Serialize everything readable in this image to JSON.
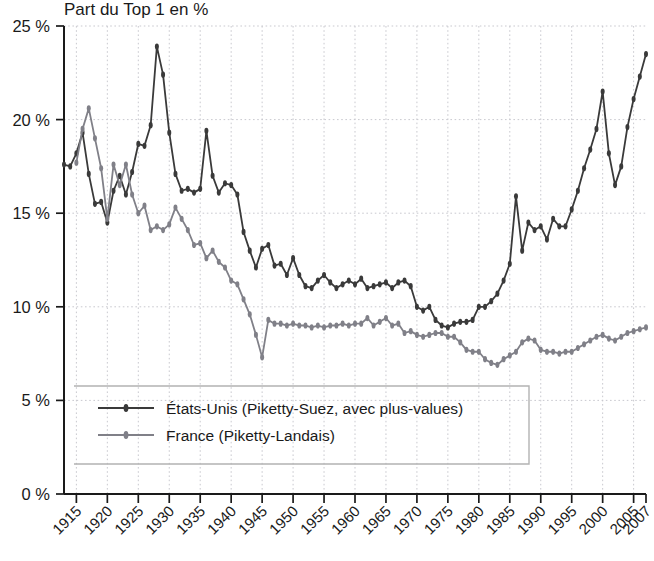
{
  "chart_data": {
    "type": "line",
    "title": "Part du Top 1 en %",
    "xlabel": "",
    "ylabel": "",
    "ylim": [
      0,
      25
    ],
    "xlim": [
      1913,
      2007
    ],
    "grid": true,
    "legend_position": "bottom-left",
    "y_ticks": [
      0,
      5,
      10,
      15,
      20,
      25
    ],
    "y_tick_labels": [
      "0 %",
      "5 %",
      "10 %",
      "15 %",
      "20 %",
      "25 %"
    ],
    "x_ticks": [
      1915,
      1920,
      1925,
      1930,
      1935,
      1940,
      1945,
      1950,
      1955,
      1960,
      1965,
      1970,
      1975,
      1980,
      1985,
      1990,
      1995,
      2000,
      2005,
      2007
    ],
    "x_tick_labels": [
      "1915",
      "1920",
      "1925",
      "1930",
      "1935",
      "1940",
      "1945",
      "1950",
      "1955",
      "1960",
      "1965",
      "1970",
      "1975",
      "1980",
      "1985",
      "1990",
      "1995",
      "2000",
      "2005",
      "2007"
    ],
    "colors": {
      "etats_unis": "#3a3a3a",
      "france": "#808088",
      "grid": "#c9c9cf",
      "axis": "#1a1a1a",
      "background": "#ffffff"
    },
    "series": [
      {
        "name": "États-Unis (Piketty-Suez, avec plus-values)",
        "color": "#3a3a3a",
        "x": [
          1913,
          1914,
          1915,
          1916,
          1917,
          1918,
          1919,
          1920,
          1921,
          1922,
          1923,
          1924,
          1925,
          1926,
          1927,
          1928,
          1929,
          1930,
          1931,
          1932,
          1933,
          1934,
          1935,
          1936,
          1937,
          1938,
          1939,
          1940,
          1941,
          1942,
          1943,
          1944,
          1945,
          1946,
          1947,
          1948,
          1949,
          1950,
          1951,
          1952,
          1953,
          1954,
          1955,
          1956,
          1957,
          1958,
          1959,
          1960,
          1961,
          1962,
          1963,
          1964,
          1965,
          1966,
          1967,
          1968,
          1969,
          1970,
          1971,
          1972,
          1973,
          1974,
          1975,
          1976,
          1977,
          1978,
          1979,
          1980,
          1981,
          1982,
          1983,
          1984,
          1985,
          1986,
          1987,
          1988,
          1989,
          1990,
          1991,
          1992,
          1993,
          1994,
          1995,
          1996,
          1997,
          1998,
          1999,
          2000,
          2001,
          2002,
          2003,
          2004,
          2005,
          2006,
          2007
        ],
        "y": [
          17.6,
          17.5,
          18.2,
          19.3,
          17.1,
          15.5,
          15.6,
          14.5,
          16.2,
          17.0,
          16.0,
          17.2,
          18.7,
          18.6,
          19.7,
          23.9,
          22.4,
          19.3,
          17.1,
          16.2,
          16.3,
          16.1,
          16.3,
          19.4,
          17.0,
          16.1,
          16.6,
          16.5,
          16.0,
          14.0,
          13.0,
          12.1,
          13.1,
          13.3,
          12.2,
          12.3,
          11.7,
          12.6,
          11.7,
          11.1,
          11.0,
          11.4,
          11.7,
          11.3,
          11.0,
          11.2,
          11.4,
          11.2,
          11.5,
          11.0,
          11.1,
          11.2,
          11.3,
          11.0,
          11.3,
          11.4,
          11.1,
          10.0,
          9.8,
          10.0,
          9.3,
          9.0,
          8.9,
          9.1,
          9.2,
          9.2,
          9.3,
          10.0,
          10.0,
          10.3,
          10.7,
          11.4,
          12.3,
          15.9,
          13.0,
          14.5,
          14.1,
          14.3,
          13.6,
          14.7,
          14.3,
          14.3,
          15.2,
          16.2,
          17.4,
          18.4,
          19.5,
          21.5,
          18.2,
          16.5,
          17.5,
          19.6,
          21.1,
          22.3,
          23.5
        ]
      },
      {
        "name": "France (Piketty-Landais)",
        "color": "#808088",
        "x": [
          1915,
          1916,
          1917,
          1918,
          1919,
          1920,
          1921,
          1922,
          1923,
          1924,
          1925,
          1926,
          1927,
          1928,
          1929,
          1930,
          1931,
          1932,
          1933,
          1934,
          1935,
          1936,
          1937,
          1938,
          1939,
          1940,
          1941,
          1942,
          1943,
          1944,
          1945,
          1946,
          1947,
          1948,
          1949,
          1950,
          1951,
          1952,
          1953,
          1954,
          1955,
          1956,
          1957,
          1958,
          1959,
          1960,
          1961,
          1962,
          1963,
          1964,
          1965,
          1966,
          1967,
          1968,
          1969,
          1970,
          1971,
          1972,
          1973,
          1974,
          1975,
          1976,
          1977,
          1978,
          1979,
          1980,
          1981,
          1982,
          1983,
          1984,
          1985,
          1986,
          1987,
          1988,
          1989,
          1990,
          1991,
          1992,
          1993,
          1994,
          1995,
          1996,
          1997,
          1998,
          1999,
          2000,
          2001,
          2002,
          2003,
          2004,
          2005,
          2006,
          2007
        ],
        "y": [
          17.7,
          19.5,
          20.6,
          19.0,
          17.4,
          14.7,
          17.6,
          16.5,
          17.6,
          16.0,
          15.0,
          15.4,
          14.1,
          14.3,
          14.1,
          14.4,
          15.3,
          14.7,
          14.1,
          13.3,
          13.4,
          12.6,
          13.0,
          12.4,
          12.1,
          11.4,
          11.2,
          10.4,
          9.6,
          8.5,
          7.3,
          9.3,
          9.1,
          9.1,
          9.0,
          9.1,
          9.0,
          9.0,
          8.9,
          9.0,
          8.9,
          9.0,
          9.0,
          9.1,
          9.0,
          9.1,
          9.1,
          9.4,
          9.0,
          9.2,
          9.4,
          9.0,
          9.1,
          8.6,
          8.7,
          8.5,
          8.4,
          8.5,
          8.6,
          8.6,
          8.4,
          8.4,
          8.1,
          7.7,
          7.6,
          7.6,
          7.2,
          7.0,
          6.9,
          7.2,
          7.4,
          7.6,
          8.1,
          8.3,
          8.2,
          7.7,
          7.6,
          7.6,
          7.5,
          7.6,
          7.6,
          7.8,
          8.0,
          8.2,
          8.4,
          8.5,
          8.3,
          8.2,
          8.4,
          8.6,
          8.7,
          8.8,
          8.9
        ]
      }
    ]
  },
  "legend": {
    "items": [
      {
        "label": "États-Unis (Piketty-Suez, avec plus-values)",
        "key": "etats-unis"
      },
      {
        "label": "France (Piketty-Landais)",
        "key": "france"
      }
    ]
  }
}
